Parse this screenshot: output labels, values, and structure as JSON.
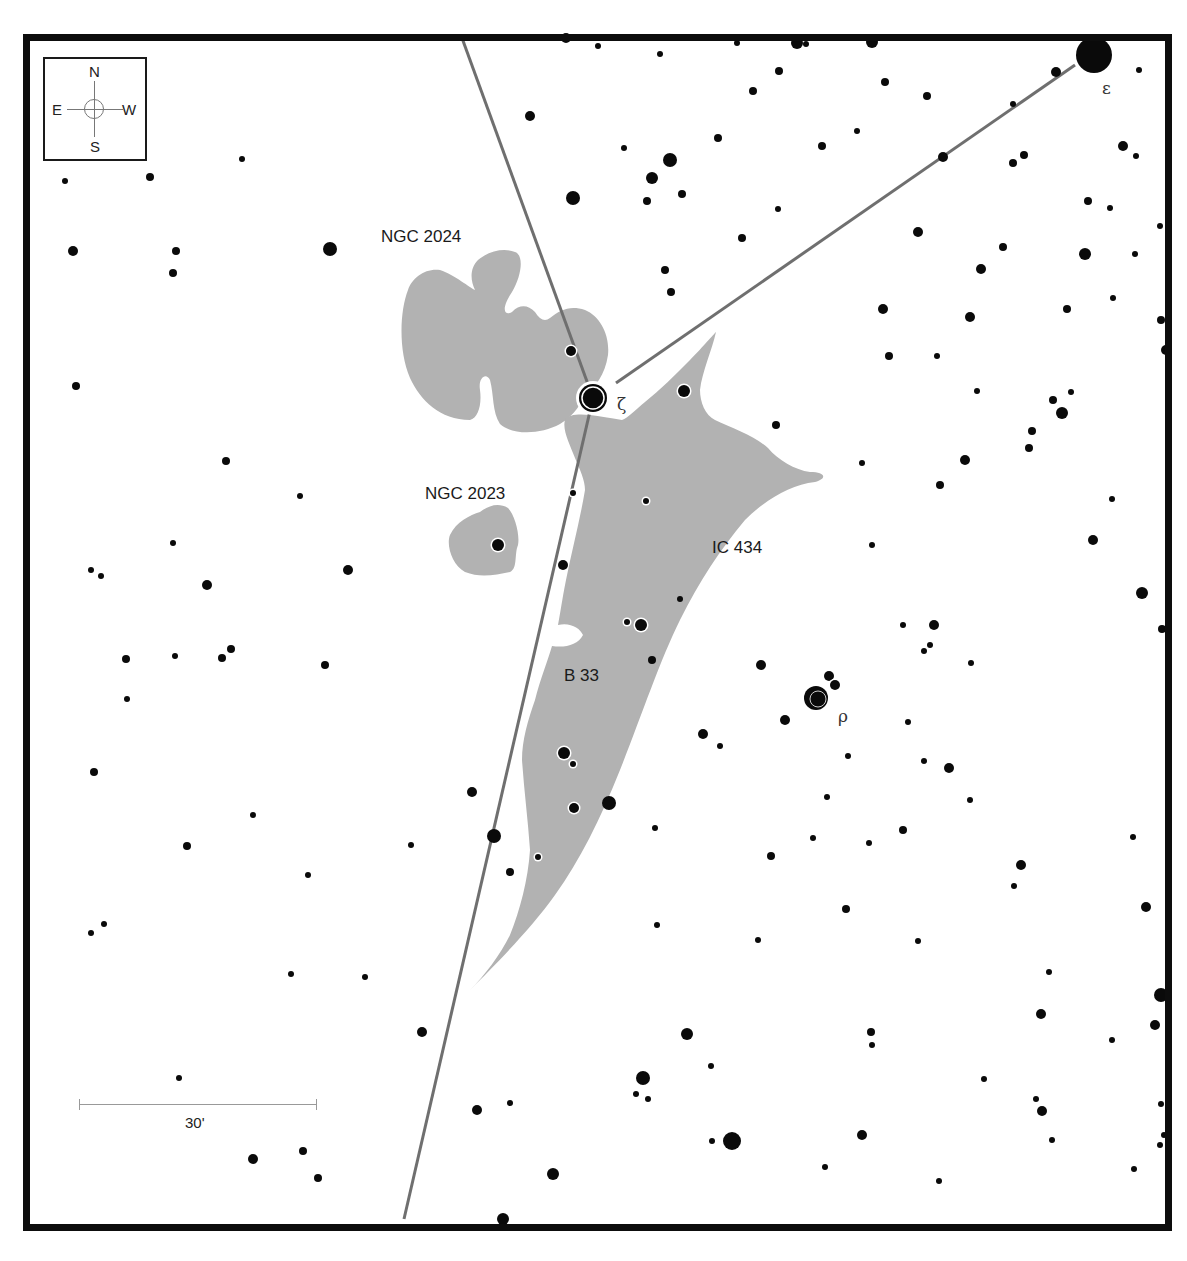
{
  "chart": {
    "colors": {
      "star": "#0a0a0a",
      "nebula": "#b2b2b2",
      "line": "#6f6f6f",
      "frame": "#0d0d0d",
      "halo": "#ffffff"
    },
    "compass": {
      "north": "N",
      "south": "S",
      "east": "E",
      "west": "W"
    },
    "scale": {
      "label": "30'"
    },
    "objects": [
      {
        "id": "ngc2024",
        "label": "NGC 2024",
        "x": 381,
        "y": 228
      },
      {
        "id": "ngc2023",
        "label": "NGC 2023",
        "x": 425,
        "y": 485
      },
      {
        "id": "ic434",
        "label": "IC 434",
        "x": 712,
        "y": 539
      },
      {
        "id": "b33",
        "label": "B 33",
        "x": 564,
        "y": 667
      }
    ],
    "named_stars": [
      {
        "id": "zeta",
        "label": "ζ",
        "x": 617,
        "y": 396,
        "cx": 593,
        "cy": 398,
        "r": 14
      },
      {
        "id": "epsilon",
        "label": "ε",
        "x": 1102,
        "y": 84,
        "cx": 1094,
        "cy": 55,
        "r": 18
      },
      {
        "id": "rho",
        "label": "ρ",
        "x": 838,
        "y": 710,
        "cx": 816,
        "cy": 698,
        "r": 12
      }
    ],
    "lines": [
      {
        "id": "line-north",
        "x1": 462,
        "y1": 38,
        "x2": 593,
        "y2": 398
      },
      {
        "id": "line-epsilon",
        "x1": 616,
        "y1": 383,
        "x2": 1075,
        "y2": 65
      },
      {
        "id": "line-south",
        "x1": 593,
        "y1": 398,
        "x2": 404,
        "y2": 1219
      }
    ],
    "nebulae": [
      {
        "id": "ngc2024-shape",
        "d": "M 408 290 C 400 310, 398 350, 410 378 C 420 400, 440 420, 470 420 C 478 418, 482 405, 480 390 C 478 378, 486 372, 490 380 C 494 395, 492 412, 500 424 C 512 435, 540 435, 560 424 C 575 415, 582 402, 585 394 C 595 388, 605 375, 608 355 C 610 335, 600 316, 585 310 C 570 305, 560 310, 550 318 C 545 322, 540 320, 535 312 C 528 305, 520 304, 512 312 C 505 316, 500 310, 512 292 C 522 275, 524 255, 515 252 C 505 248, 490 250, 478 260 C 470 268, 470 280, 475 290 C 470 288, 455 275, 440 270 C 425 268, 412 278, 408 290 Z"
      },
      {
        "id": "ngc2023-shape",
        "d": "M 450 535 C 446 545, 452 565, 465 572 C 480 578, 495 575, 510 572 C 518 568, 514 555, 518 545 C 520 535, 515 515, 508 508 C 498 502, 488 506, 480 512 C 470 515, 456 522, 450 535 Z"
      },
      {
        "id": "ic434-shape",
        "d": "M 565 420 C 562 430, 570 445, 575 458 C 580 470, 585 480, 585 490 C 580 520, 572 550, 566 580 C 562 600, 560 615, 558 625 C 570 622, 580 628, 583 635 C 578 645, 565 648, 552 646 C 548 660, 540 680, 535 700 C 528 720, 522 740, 522 760 C 524 790, 528 820, 530 850 C 528 880, 520 910, 510 935 C 500 955, 485 975, 470 990 C 495 965, 530 930, 555 895 C 580 860, 600 820, 620 770 C 640 720, 660 660, 680 620 C 700 580, 720 550, 745 520 C 765 500, 790 485, 815 482 C 828 478, 825 472, 810 472 C 795 470, 778 460, 768 448 C 755 436, 732 428, 715 420 C 705 415, 700 402, 700 390 C 702 372, 712 350, 716 332 C 712 336, 700 350, 690 360 C 675 375, 660 390, 645 402 C 635 410, 628 418, 622 420 C 610 418, 600 416, 590 415 C 580 414, 568 414, 565 420 Z"
      }
    ],
    "stars": [
      [
        566,
        38,
        5
      ],
      [
        598,
        46,
        3
      ],
      [
        660,
        54,
        3
      ],
      [
        737,
        43,
        3
      ],
      [
        797,
        43,
        6
      ],
      [
        806,
        44,
        3
      ],
      [
        872,
        42,
        6
      ],
      [
        779,
        71,
        4
      ],
      [
        885,
        82,
        4
      ],
      [
        1139,
        70,
        3
      ],
      [
        753,
        91,
        4
      ],
      [
        927,
        96,
        4
      ],
      [
        530,
        116,
        5
      ],
      [
        718,
        138,
        4
      ],
      [
        857,
        131,
        3
      ],
      [
        822,
        146,
        4
      ],
      [
        1056,
        72,
        5
      ],
      [
        1013,
        104,
        3
      ],
      [
        1123,
        146,
        5
      ],
      [
        1136,
        156,
        3
      ],
      [
        943,
        157,
        5
      ],
      [
        1013,
        163,
        4
      ],
      [
        1024,
        155,
        4
      ],
      [
        624,
        148,
        3
      ],
      [
        670,
        160,
        7
      ],
      [
        652,
        178,
        6
      ],
      [
        682,
        194,
        4
      ],
      [
        647,
        201,
        4
      ],
      [
        573,
        198,
        7
      ],
      [
        778,
        209,
        3
      ],
      [
        1088,
        201,
        4
      ],
      [
        1110,
        208,
        3
      ],
      [
        1160,
        226,
        3
      ],
      [
        742,
        238,
        4
      ],
      [
        918,
        232,
        5
      ],
      [
        1003,
        247,
        4
      ],
      [
        981,
        269,
        5
      ],
      [
        1085,
        254,
        6
      ],
      [
        1135,
        254,
        3
      ],
      [
        665,
        270,
        4
      ],
      [
        671,
        292,
        4
      ],
      [
        1113,
        298,
        3
      ],
      [
        883,
        309,
        5
      ],
      [
        970,
        317,
        5
      ],
      [
        1067,
        309,
        4
      ],
      [
        1161,
        320,
        4
      ],
      [
        1166,
        350,
        5
      ],
      [
        889,
        356,
        4
      ],
      [
        937,
        356,
        3
      ],
      [
        1071,
        392,
        3
      ],
      [
        1053,
        400,
        4
      ],
      [
        1062,
        413,
        6
      ],
      [
        977,
        391,
        3
      ],
      [
        776,
        425,
        4
      ],
      [
        1032,
        431,
        4
      ],
      [
        1029,
        448,
        4
      ],
      [
        965,
        460,
        5
      ],
      [
        862,
        463,
        3
      ],
      [
        940,
        485,
        4
      ],
      [
        1112,
        499,
        3
      ],
      [
        1093,
        540,
        5
      ],
      [
        1142,
        593,
        6
      ],
      [
        1162,
        629,
        4
      ],
      [
        872,
        545,
        3
      ],
      [
        934,
        625,
        5
      ],
      [
        903,
        625,
        3
      ],
      [
        930,
        645,
        3
      ],
      [
        924,
        651,
        3
      ],
      [
        971,
        663,
        3
      ],
      [
        761,
        665,
        5
      ],
      [
        785,
        720,
        5
      ],
      [
        703,
        734,
        5
      ],
      [
        720,
        746,
        3
      ],
      [
        848,
        756,
        3
      ],
      [
        908,
        722,
        3
      ],
      [
        924,
        761,
        3
      ],
      [
        949,
        768,
        5
      ],
      [
        827,
        797,
        3
      ],
      [
        970,
        800,
        3
      ],
      [
        655,
        828,
        3
      ],
      [
        813,
        838,
        3
      ],
      [
        903,
        830,
        4
      ],
      [
        1133,
        837,
        3
      ],
      [
        1021,
        865,
        5
      ],
      [
        1014,
        886,
        3
      ],
      [
        771,
        856,
        4
      ],
      [
        869,
        843,
        3
      ],
      [
        846,
        909,
        4
      ],
      [
        1146,
        907,
        5
      ],
      [
        657,
        925,
        3
      ],
      [
        918,
        941,
        3
      ],
      [
        758,
        940,
        3
      ],
      [
        1049,
        972,
        3
      ],
      [
        1161,
        995,
        7
      ],
      [
        1155,
        1025,
        5
      ],
      [
        1041,
        1014,
        5
      ],
      [
        1112,
        1040,
        3
      ],
      [
        871,
        1032,
        4
      ],
      [
        872,
        1045,
        3
      ],
      [
        687,
        1034,
        6
      ],
      [
        711,
        1066,
        3
      ],
      [
        643,
        1078,
        7
      ],
      [
        636,
        1094,
        3
      ],
      [
        648,
        1099,
        3
      ],
      [
        984,
        1079,
        3
      ],
      [
        1036,
        1099,
        3
      ],
      [
        1042,
        1111,
        5
      ],
      [
        732,
        1141,
        9
      ],
      [
        712,
        1141,
        3
      ],
      [
        862,
        1135,
        5
      ],
      [
        1052,
        1140,
        3
      ],
      [
        1164,
        1135,
        3
      ],
      [
        1160,
        1145,
        3
      ],
      [
        939,
        1181,
        3
      ],
      [
        553,
        1174,
        6
      ],
      [
        825,
        1167,
        3
      ],
      [
        1134,
        1169,
        3
      ],
      [
        503,
        1219,
        6
      ],
      [
        242,
        159,
        3
      ],
      [
        150,
        177,
        4
      ],
      [
        65,
        181,
        3
      ],
      [
        73,
        251,
        5
      ],
      [
        176,
        251,
        4
      ],
      [
        173,
        273,
        4
      ],
      [
        330,
        249,
        7
      ],
      [
        76,
        386,
        4
      ],
      [
        226,
        461,
        4
      ],
      [
        300,
        496,
        3
      ],
      [
        173,
        543,
        3
      ],
      [
        91,
        570,
        3
      ],
      [
        101,
        576,
        3
      ],
      [
        207,
        585,
        5
      ],
      [
        348,
        570,
        5
      ],
      [
        126,
        659,
        4
      ],
      [
        175,
        656,
        3
      ],
      [
        222,
        658,
        4
      ],
      [
        231,
        649,
        4
      ],
      [
        325,
        665,
        4
      ],
      [
        127,
        699,
        3
      ],
      [
        94,
        772,
        4
      ],
      [
        253,
        815,
        3
      ],
      [
        187,
        846,
        4
      ],
      [
        308,
        875,
        3
      ],
      [
        411,
        845,
        3
      ],
      [
        91,
        933,
        3
      ],
      [
        104,
        924,
        3
      ],
      [
        291,
        974,
        3
      ],
      [
        365,
        977,
        3
      ],
      [
        179,
        1078,
        3
      ],
      [
        422,
        1032,
        5
      ],
      [
        477,
        1110,
        5
      ],
      [
        510,
        1103,
        3
      ],
      [
        253,
        1159,
        5
      ],
      [
        303,
        1151,
        4
      ],
      [
        318,
        1178,
        4
      ],
      [
        472,
        792,
        5
      ],
      [
        494,
        836,
        7
      ],
      [
        510,
        872,
        4
      ],
      [
        609,
        803,
        7
      ],
      [
        652,
        660,
        4
      ],
      [
        680,
        599,
        3
      ],
      [
        563,
        565,
        5
      ],
      [
        1161,
        1104,
        3
      ]
    ],
    "haloed_stars": [
      [
        571,
        351,
        5
      ],
      [
        684,
        391,
        6
      ],
      [
        498,
        545,
        6
      ],
      [
        646,
        501,
        3
      ],
      [
        573,
        493,
        3
      ],
      [
        641,
        625,
        6
      ],
      [
        627,
        622,
        3
      ],
      [
        564,
        753,
        6
      ],
      [
        573,
        764,
        3
      ],
      [
        574,
        808,
        5
      ],
      [
        538,
        857,
        3
      ],
      [
        829,
        676,
        5
      ],
      [
        835,
        685,
        5
      ]
    ]
  }
}
